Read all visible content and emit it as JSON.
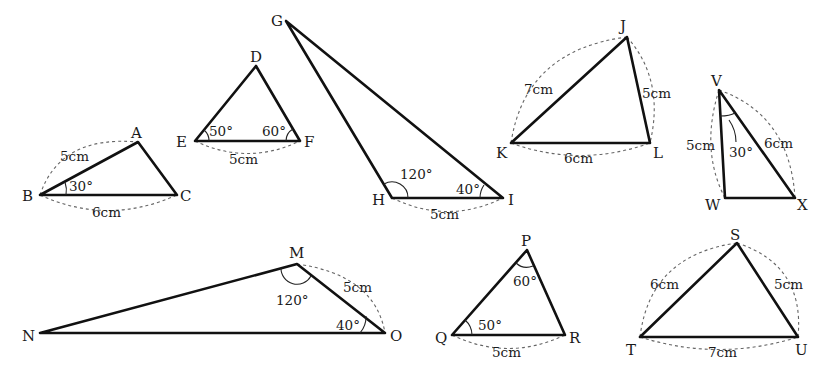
{
  "figure": {
    "triangles": [
      {
        "id": "ABC",
        "vertices": {
          "A": "A",
          "B": "B",
          "C": "C"
        },
        "measures": {
          "side_BA": "5cm",
          "side_BC": "6cm",
          "angle_B": "30°"
        }
      },
      {
        "id": "DEF",
        "vertices": {
          "D": "D",
          "E": "E",
          "F": "F"
        },
        "measures": {
          "side_EF": "5cm",
          "angle_E": "50°",
          "angle_F": "60°"
        }
      },
      {
        "id": "GHI",
        "vertices": {
          "G": "G",
          "H": "H",
          "I": "I"
        },
        "measures": {
          "side_HI": "5cm",
          "angle_H": "120°",
          "angle_I": "40°"
        }
      },
      {
        "id": "JKL",
        "vertices": {
          "J": "J",
          "K": "K",
          "L": "L"
        },
        "measures": {
          "side_KJ": "7cm",
          "side_JL": "5cm",
          "side_KL": "6cm"
        }
      },
      {
        "id": "VWX",
        "vertices": {
          "V": "V",
          "W": "W",
          "X": "X"
        },
        "measures": {
          "side_VW": "5cm",
          "side_VX": "6cm",
          "angle_V": "30°"
        }
      },
      {
        "id": "MNO",
        "vertices": {
          "M": "M",
          "N": "N",
          "O": "O"
        },
        "measures": {
          "side_MO": "5cm",
          "angle_M": "120°",
          "angle_O": "40°"
        }
      },
      {
        "id": "PQR",
        "vertices": {
          "P": "P",
          "Q": "Q",
          "R": "R"
        },
        "measures": {
          "side_QR": "5cm",
          "angle_P": "60°",
          "angle_Q": "50°"
        }
      },
      {
        "id": "STU",
        "vertices": {
          "S": "S",
          "T": "T",
          "U": "U"
        },
        "measures": {
          "side_TS": "6cm",
          "side_SU": "5cm",
          "side_TU": "7cm"
        }
      }
    ]
  },
  "colors": {
    "edge": "#111111",
    "dashed_arc": "#666666",
    "background": "#ffffff"
  }
}
